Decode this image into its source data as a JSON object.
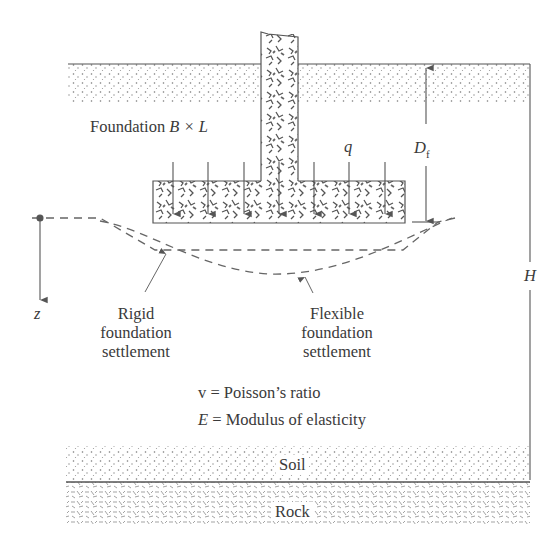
{
  "diagram": {
    "labels": {
      "foundation": "Foundation",
      "foundation_dims": "B × L",
      "load": "q",
      "depth_symbol": "D",
      "depth_subscript": "f",
      "thickness": "H",
      "depth_axis": "z",
      "rigid_line1": "Rigid",
      "rigid_line2": "foundation",
      "rigid_line3": "settlement",
      "flexible_line1": "Flexible",
      "flexible_line2": "foundation",
      "flexible_line3": "settlement",
      "poisson_symbol": "v",
      "poisson_text": "= Poisson’s ratio",
      "modulus_symbol": "E",
      "modulus_text": "= Modulus of elasticity",
      "soil": "Soil",
      "rock": "Rock"
    },
    "colors": {
      "ink": "#4a4a4a",
      "text": "#3a3a3a",
      "background": "#ffffff"
    }
  }
}
